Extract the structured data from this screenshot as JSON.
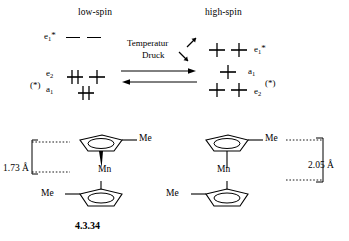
{
  "figure": {
    "caption": "4.3.34",
    "headings": {
      "left": "low-spin",
      "right": "high-spin"
    },
    "conditions": {
      "up_label": "Temperatur",
      "down_label": "Druck",
      "up_arrow_icon": "arrow-up-right-icon",
      "down_arrow_icon": "arrow-down-right-icon",
      "equilibrium_icon": "equilibrium-arrows-icon"
    },
    "orbital_diagram": {
      "low_spin": {
        "marker": "(*)",
        "levels": [
          {
            "term": "e",
            "sub": "1",
            "star": "*",
            "label": "e1*",
            "occupancy": [
              "empty",
              "empty"
            ]
          },
          {
            "term": "e",
            "sub": "2",
            "star": "",
            "label": "e2",
            "occupancy": [
              "pair",
              "single"
            ]
          },
          {
            "term": "a",
            "sub": "1",
            "star": "",
            "label": "a1",
            "occupancy": [
              "pair"
            ]
          }
        ]
      },
      "high_spin": {
        "marker": "(*)",
        "levels": [
          {
            "term": "e",
            "sub": "1",
            "star": "*",
            "label": "e1*",
            "occupancy": [
              "single",
              "single"
            ]
          },
          {
            "term": "a",
            "sub": "1",
            "star": "",
            "label": "a1",
            "occupancy": [
              "single"
            ]
          },
          {
            "term": "e",
            "sub": "2",
            "star": "",
            "label": "e2",
            "occupancy": [
              "single",
              "single"
            ]
          }
        ]
      }
    },
    "structures": {
      "left": {
        "metal": "Mn",
        "methyl_top": "Me",
        "methyl_bottom": "Me",
        "distance": "1.73 Å",
        "ring_icon": "cyclopentadienyl-ring-icon"
      },
      "right": {
        "metal": "Mn",
        "methyl_top": "Me",
        "methyl_bottom": "Me",
        "distance": "2.05 Å",
        "ring_icon": "cyclopentadienyl-ring-icon"
      }
    }
  }
}
